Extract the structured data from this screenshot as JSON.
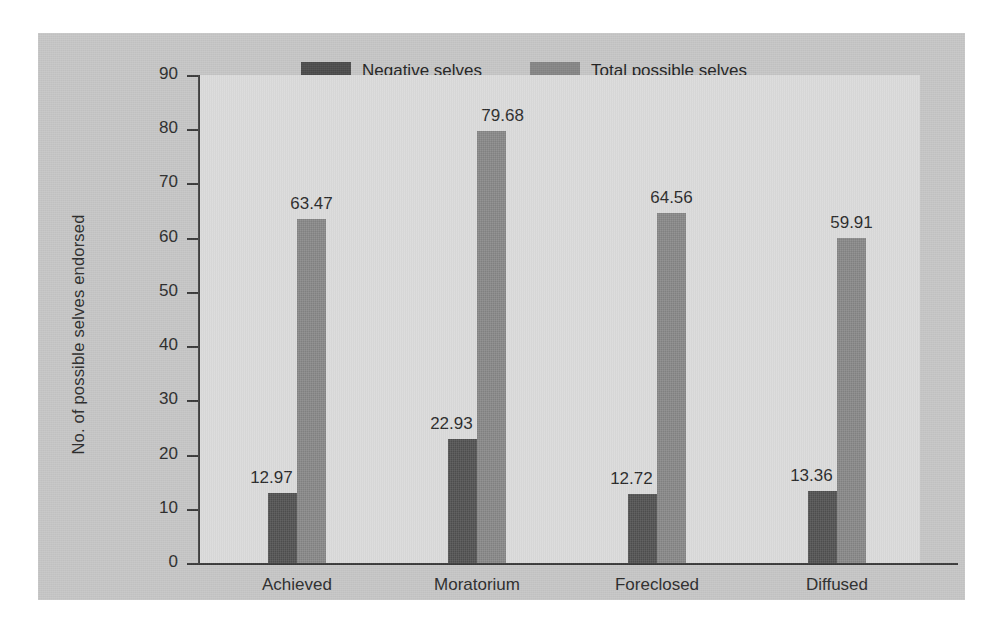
{
  "chart_data": {
    "type": "bar",
    "title": "",
    "subtitle": "",
    "xlabel": "",
    "ylabel": "No. of possible selves endorsed",
    "categories": [
      "Achieved",
      "Moratorium",
      "Foreclosed",
      "Diffused"
    ],
    "series": [
      {
        "name": "Negative selves",
        "color": "#4b4b4b",
        "values": [
          12.97,
          22.93,
          12.72,
          13.36
        ],
        "labels": [
          "12.97",
          "22.93",
          "12.72",
          "13.36"
        ]
      },
      {
        "name": "Total possible selves",
        "color": "#858585",
        "values": [
          63.47,
          79.68,
          64.56,
          59.91
        ],
        "labels": [
          "63.47",
          "79.68",
          "64.56",
          "59.91"
        ]
      }
    ],
    "ylim": [
      0,
      90
    ],
    "yticks": [
      0,
      10,
      20,
      30,
      40,
      50,
      60,
      70,
      80,
      90
    ],
    "ytick_labels": [
      "0",
      "10",
      "20",
      "30",
      "40",
      "50",
      "60",
      "70",
      "80",
      "90"
    ],
    "grid": false,
    "legend_position": "top-center",
    "plot_background": "#dddddd",
    "figure_background": "#c6c6c6",
    "axis_color": "#3a3a3a"
  },
  "legend": {
    "items": [
      {
        "label": "Negative selves"
      },
      {
        "label": "Total possible selves"
      }
    ]
  }
}
